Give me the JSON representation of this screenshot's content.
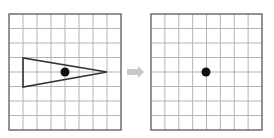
{
  "diagram": {
    "left_panel": {
      "grid": {
        "x": 9,
        "y": 14,
        "width": 112,
        "height": 116,
        "cols": 8,
        "rows": 8
      },
      "triangle": {
        "points": [
          [
            23,
            58
          ],
          [
            23,
            87
          ],
          [
            107,
            72
          ]
        ],
        "stroke": "#333333"
      },
      "dot": {
        "cx": 65,
        "cy": 72,
        "r": 4.5,
        "fill": "#111111"
      }
    },
    "arrow": {
      "from_x": 127,
      "to_x": 144,
      "y": 72,
      "color": "#c8c8c8"
    },
    "right_panel": {
      "grid": {
        "x": 151,
        "y": 14,
        "width": 111,
        "height": 116,
        "cols": 8,
        "rows": 8
      },
      "dot": {
        "cx": 206,
        "cy": 72,
        "r": 4.5,
        "fill": "#111111"
      }
    },
    "colors": {
      "grid_line": "#b5b5b5",
      "grid_border": "#666666"
    }
  }
}
